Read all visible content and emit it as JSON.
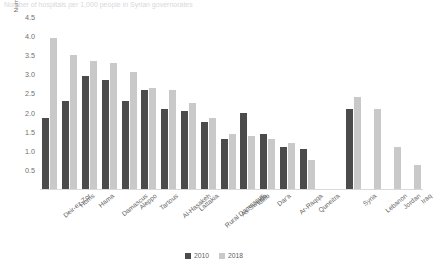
{
  "chart_data": {
    "type": "bar",
    "title": "Number of hospitals per 1,000 people in Syrian governorates",
    "xlabel": "",
    "ylabel": "Number of hospitals per 1,000 people",
    "ylim": [
      0,
      4.5
    ],
    "yticks": [
      "0.5",
      "1.0",
      "1.5",
      "2.0",
      "2.5",
      "3.0",
      "3.5",
      "4.0",
      "4.5"
    ],
    "ytick_values": [
      0.5,
      1.0,
      1.5,
      2.0,
      2.5,
      3.0,
      3.5,
      4.0,
      4.5
    ],
    "grid": false,
    "legend_position": "bottom",
    "categories": [
      "Deir-ez-Zor",
      "Homs",
      "Hama",
      "Damascus",
      "Aleppo",
      "Tartous",
      "Al-Hasakeh",
      "Lattakia",
      "Rural Damascus",
      "As-Sweida",
      "Idleb",
      "Dar'a",
      "Ar-Raqqa",
      "Quneitra",
      "Syria",
      "Lebanon",
      "Jordan",
      "Iraq"
    ],
    "gap_after_index": 13,
    "series": [
      {
        "name": "2010",
        "color": "#4b4b4b",
        "values": [
          1.85,
          2.3,
          2.95,
          2.85,
          2.3,
          2.6,
          2.1,
          2.05,
          1.75,
          1.3,
          2.0,
          1.43,
          1.1,
          1.05,
          2.1,
          null,
          null,
          null
        ]
      },
      {
        "name": "2018",
        "color": "#c9c9c9",
        "values": [
          3.95,
          3.5,
          3.35,
          3.3,
          3.05,
          2.65,
          2.6,
          2.25,
          1.85,
          1.45,
          1.4,
          1.3,
          1.2,
          0.75,
          2.4,
          2.1,
          1.1,
          0.62
        ]
      }
    ]
  }
}
